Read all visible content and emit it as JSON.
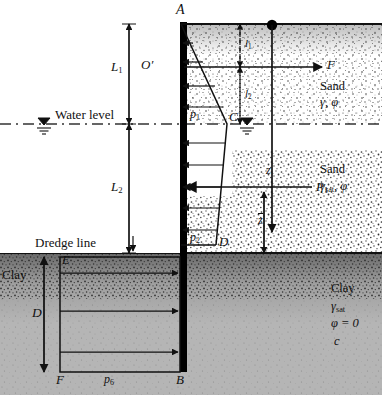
{
  "figure": {
    "type": "engineering-diagram"
  },
  "soil_layers": [
    {
      "name": "sand-dry",
      "label": "Sand",
      "props": [
        "γ, φ"
      ],
      "fill": "dry-sand-stipple"
    },
    {
      "name": "sand-sat",
      "label": "Sand",
      "props": [
        "γsat, φ"
      ],
      "fill": "sat-sand-stipple"
    },
    {
      "name": "clay",
      "label": "Clay",
      "props": [
        "γsat",
        "φ = 0",
        "c"
      ],
      "fill": "gray-clay"
    }
  ],
  "labels": {
    "point_A": "A",
    "point_O": "O′",
    "point_C": "C",
    "point_D": "D",
    "point_E": "E",
    "point_F_bottom": "F",
    "point_B": "B",
    "dim_L1": "L1",
    "dim_L2": "L2",
    "dim_D": "D",
    "dim_l1": "l1",
    "dim_l2": "l2",
    "dim_z": "z",
    "dim_zbar": "z",
    "pressure_p1": "p1",
    "pressure_p2": "p2",
    "pressure_p6": "p6",
    "force_F": "F",
    "force_P1": "P1",
    "water_level": "Water level",
    "dredge_line": "Dredge line",
    "sand": "Sand",
    "clay": "Clay",
    "sand_dry_props": "γ, φ",
    "sand_sat_props_g": "γ",
    "sand_sat_props_sub": "sat",
    "sand_sat_props_rest": ", φ",
    "clay_props_g": "γ",
    "clay_props_sub": "sat",
    "clay_phi": "φ = 0",
    "clay_c": "c"
  },
  "colors": {
    "ink": "#111111",
    "clay_fill": "#b3b3b3",
    "sand_dry_fill": "#ffffff",
    "sand_sat_fill": "#ffffff",
    "wall": "#000000",
    "water_line": "#444444",
    "background": "#ffffff"
  },
  "geometry": {
    "wall_x": 183,
    "top_y": 22,
    "water_y": 124,
    "dredge_y": 253,
    "bottom_y": 372,
    "anchor_x": 272,
    "anchor_y": 25,
    "tie_y": 67
  }
}
